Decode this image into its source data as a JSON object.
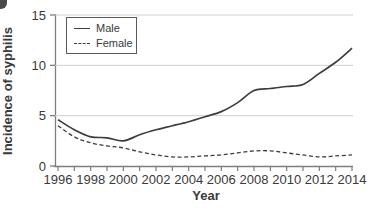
{
  "chart_data": {
    "type": "line",
    "title": "",
    "xlabel": "Year",
    "ylabel": "Incidence of syphilis",
    "x": [
      1996,
      1997,
      1998,
      1999,
      2000,
      2001,
      2002,
      2003,
      2004,
      2005,
      2006,
      2007,
      2008,
      2009,
      2010,
      2011,
      2012,
      2013,
      2014
    ],
    "series": [
      {
        "name": "Male",
        "style": "solid",
        "values": [
          4.6,
          3.6,
          2.9,
          2.8,
          2.5,
          3.1,
          3.6,
          4.0,
          4.4,
          4.9,
          5.4,
          6.3,
          7.5,
          7.7,
          7.9,
          8.1,
          9.2,
          10.3,
          11.7
        ]
      },
      {
        "name": "Female",
        "style": "dashed",
        "values": [
          4.0,
          2.9,
          2.3,
          2.0,
          1.8,
          1.4,
          1.1,
          0.9,
          0.9,
          1.0,
          1.1,
          1.3,
          1.5,
          1.5,
          1.3,
          1.1,
          0.9,
          1.0,
          1.1
        ]
      }
    ],
    "xlim": [
      1996,
      2014
    ],
    "ylim": [
      0,
      15
    ],
    "yticks": [
      0,
      5,
      10,
      15
    ],
    "xtick_labels": [
      1996,
      1998,
      2000,
      2002,
      2004,
      2006,
      2008,
      2010,
      2012,
      2014
    ],
    "minor_xticks_every_year": true,
    "grid": "horizontal",
    "legend_position": "top-left-inside",
    "colors": {
      "line": "#3d3d3d",
      "grid": "#cfcfcf",
      "axis": "#7d7d7d",
      "text": "#3a3a3a",
      "background": "#ffffff"
    }
  }
}
